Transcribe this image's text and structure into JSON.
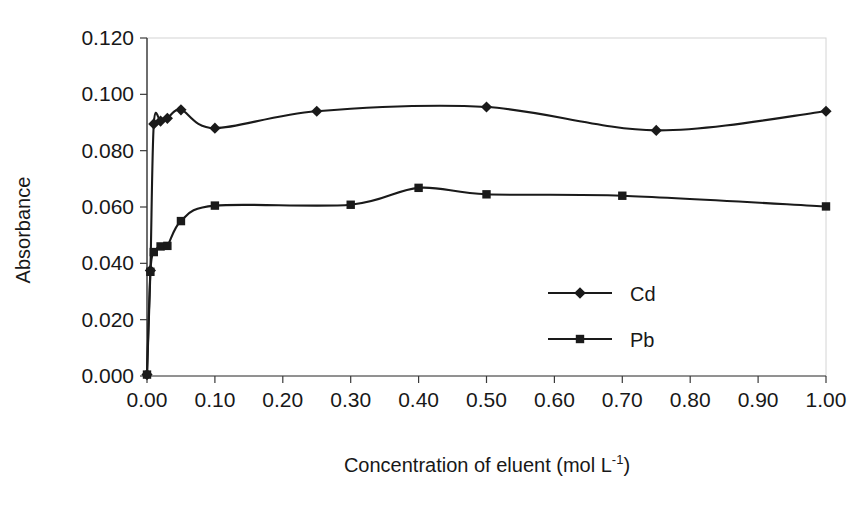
{
  "chart_data": {
    "type": "line",
    "title": "",
    "xlabel": "Concentration of eluent (mol L-1)",
    "xlabel_base": "Concentration of eluent (mol L",
    "xlabel_sup": "-1",
    "xlabel_tail": ")",
    "ylabel": "Absorbance",
    "xlim": [
      0.0,
      1.0
    ],
    "ylim": [
      0.0,
      0.12
    ],
    "xticks": [
      "0.00",
      "0.10",
      "0.20",
      "0.30",
      "0.40",
      "0.50",
      "0.60",
      "0.70",
      "0.80",
      "0.90",
      "1.00"
    ],
    "xtick_values": [
      0.0,
      0.1,
      0.2,
      0.3,
      0.4,
      0.5,
      0.6,
      0.7,
      0.8,
      0.9,
      1.0
    ],
    "yticks": [
      "0.000",
      "0.020",
      "0.040",
      "0.060",
      "0.080",
      "0.100",
      "0.120"
    ],
    "ytick_values": [
      0.0,
      0.02,
      0.04,
      0.06,
      0.08,
      0.1,
      0.12
    ],
    "grid": false,
    "legend_position": "inside-right",
    "line_color": "#1a1a1a",
    "series": [
      {
        "name": "Cd",
        "marker": "diamond",
        "color": "#1a1a1a",
        "x": [
          0.0,
          0.005,
          0.01,
          0.02,
          0.03,
          0.05,
          0.1,
          0.25,
          0.5,
          0.75,
          1.0
        ],
        "y": [
          0.0005,
          0.0375,
          0.0895,
          0.0905,
          0.0915,
          0.0945,
          0.088,
          0.094,
          0.0955,
          0.0872,
          0.094
        ]
      },
      {
        "name": "Pb",
        "marker": "square",
        "color": "#1a1a1a",
        "x": [
          0.0,
          0.005,
          0.01,
          0.02,
          0.03,
          0.05,
          0.1,
          0.3,
          0.4,
          0.5,
          0.7,
          1.0
        ],
        "y": [
          0.0005,
          0.037,
          0.044,
          0.046,
          0.0462,
          0.055,
          0.0605,
          0.0608,
          0.0668,
          0.0645,
          0.064,
          0.0602
        ]
      }
    ],
    "legend": [
      {
        "label": "Cd",
        "marker": "diamond"
      },
      {
        "label": "Pb",
        "marker": "square"
      }
    ]
  }
}
